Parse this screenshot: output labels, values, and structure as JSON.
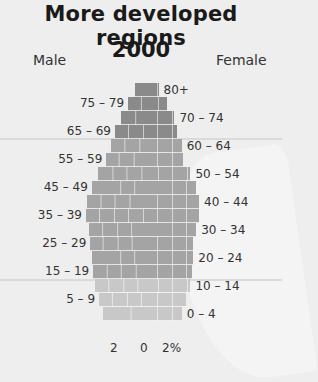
{
  "title": "More developed regions",
  "year": "2000",
  "labels": {
    "male": "Male",
    "female": "Female"
  },
  "colors": {
    "old": "#8a8a8a",
    "middle": "#a4a4a4",
    "young": "#c8c8c8",
    "background": "#eeeeee"
  },
  "axis": {
    "ticks": [
      "2",
      "0",
      "2%"
    ],
    "px_per_percent": 14.5,
    "center_x": 144
  },
  "chart_data": {
    "type": "bar",
    "subtype": "population-pyramid",
    "xlabel": "% of population",
    "ylabel": "Age group",
    "x_ticks": [
      "2",
      "0",
      "2%"
    ],
    "legend": [
      "Male",
      "Female"
    ],
    "categories": [
      "80+",
      "75 – 79",
      "70 – 74",
      "65 – 69",
      "60 – 64",
      "55 – 59",
      "50 – 54",
      "45 – 49",
      "40 – 44",
      "35 – 39",
      "30 – 34",
      "25 – 29",
      "20 – 24",
      "15 – 19",
      "10 – 14",
      "5 – 9",
      "0 – 4"
    ],
    "series": [
      {
        "name": "Male",
        "side": "left",
        "values": [
          0.6,
          1.1,
          1.6,
          2.0,
          2.3,
          2.6,
          3.2,
          3.6,
          3.9,
          4.0,
          3.8,
          3.7,
          3.6,
          3.5,
          3.4,
          3.1,
          2.8
        ]
      },
      {
        "name": "Female",
        "side": "right",
        "values": [
          1.0,
          1.6,
          2.1,
          2.3,
          2.6,
          2.7,
          3.2,
          3.6,
          3.8,
          3.8,
          3.6,
          3.4,
          3.4,
          3.3,
          3.2,
          2.9,
          2.6
        ]
      }
    ],
    "label_side": [
      "right",
      "left",
      "right",
      "left",
      "right",
      "left",
      "right",
      "left",
      "right",
      "left",
      "right",
      "left",
      "right",
      "left",
      "right",
      "left",
      "right"
    ],
    "shade_group": [
      "old",
      "old",
      "old",
      "old",
      "middle",
      "middle",
      "middle",
      "middle",
      "middle",
      "middle",
      "middle",
      "middle",
      "middle",
      "middle",
      "young",
      "young",
      "young"
    ],
    "grid": true
  }
}
